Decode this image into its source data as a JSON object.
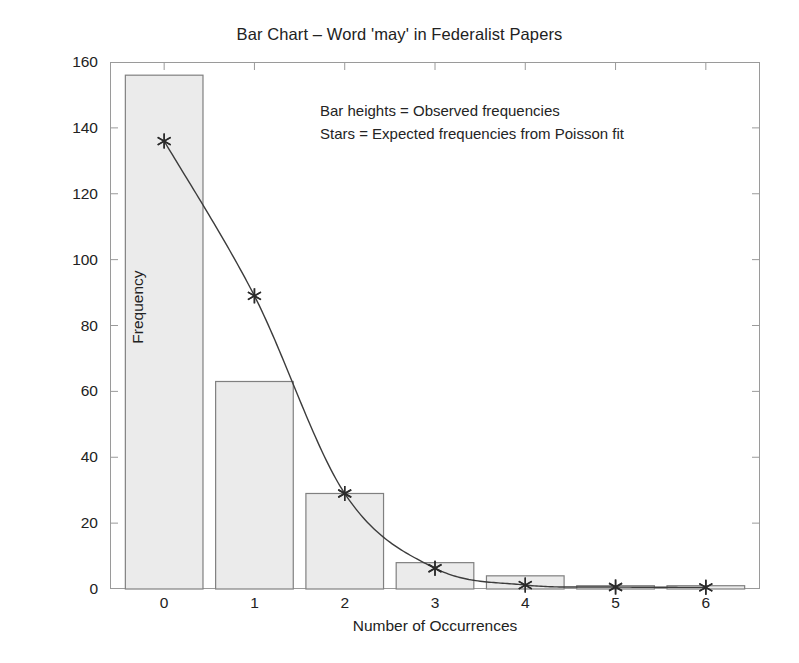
{
  "chart_data": {
    "type": "bar",
    "title": "Bar Chart – Word 'may' in Federalist Papers",
    "xlabel": "Number of Occurrences",
    "ylabel": "Frequency",
    "categories": [
      "0",
      "1",
      "2",
      "3",
      "4",
      "5",
      "6"
    ],
    "x": [
      0,
      1,
      2,
      3,
      4,
      5,
      6
    ],
    "values": [
      156,
      63,
      29,
      8,
      4,
      1,
      1
    ],
    "series": [
      {
        "name": "Observed frequencies",
        "type": "bar",
        "values": [
          156,
          63,
          29,
          8,
          4,
          1,
          1
        ]
      },
      {
        "name": "Expected frequencies from Poisson fit",
        "type": "line-with-star-markers",
        "values": [
          136,
          89,
          29,
          6.3,
          1.2,
          0.6,
          0.5
        ]
      }
    ],
    "xlim": [
      -0.6,
      6.6
    ],
    "ylim": [
      0,
      160
    ],
    "yticks": [
      0,
      20,
      40,
      60,
      80,
      100,
      120,
      140,
      160
    ],
    "ytick_labels": [
      "0",
      "20",
      "40",
      "60",
      "80",
      "100",
      "120",
      "140",
      "160"
    ],
    "xticks": [
      0,
      1,
      2,
      3,
      4,
      5,
      6
    ],
    "xtick_labels": [
      "0",
      "1",
      "2",
      "3",
      "4",
      "5",
      "6"
    ],
    "grid": false,
    "legend_position": "none",
    "annotations": [
      "Bar heights = Observed frequencies",
      "Stars = Expected frequencies from Poisson fit"
    ],
    "colors": {
      "bar_fill": "#ebebeb",
      "bar_edge": "#808080",
      "curve": "#3c3c3c",
      "marker": "#2b2b2b",
      "axis": "#9a9a9a",
      "text": "#222222",
      "background": "#ffffff"
    }
  }
}
